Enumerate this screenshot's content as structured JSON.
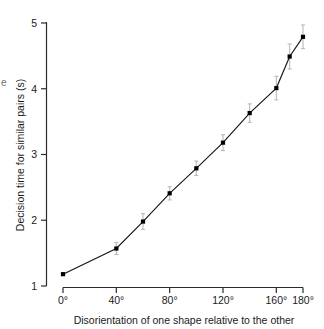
{
  "figure": {
    "partial_left_label": "e"
  },
  "chart_data": {
    "type": "line",
    "title": "",
    "subtitle": "",
    "xlabel": "Disorientation of one shape relative to the other",
    "ylabel": "Decision time for similar pairs (s)",
    "xlim": [
      0,
      180
    ],
    "ylim": [
      1,
      5
    ],
    "grid": false,
    "legend": "none",
    "x_tick_labels": [
      "0°",
      "40°",
      "80°",
      "120°",
      "160°",
      "180°"
    ],
    "x_tick_values": [
      0,
      40,
      80,
      120,
      160,
      180
    ],
    "y_tick_labels": [
      "1",
      "2",
      "3",
      "4",
      "5"
    ],
    "y_tick_values": [
      1,
      2,
      3,
      4,
      5
    ],
    "x": [
      0,
      40,
      60,
      80,
      100,
      120,
      140,
      160,
      170,
      180
    ],
    "y": [
      1.18,
      1.57,
      1.98,
      2.41,
      2.79,
      3.18,
      3.63,
      4.01,
      4.49,
      4.79
    ],
    "yerr": [
      0.0,
      0.09,
      0.12,
      0.1,
      0.11,
      0.12,
      0.14,
      0.18,
      0.19,
      0.18
    ],
    "marker": "square",
    "marker_color": "#000000",
    "line_color": "#171717",
    "errorbar_color": "#b9b9b9",
    "series": [
      {
        "name": "Decision time for similar pairs",
        "values": [
          1.18,
          1.57,
          1.98,
          2.41,
          2.79,
          3.18,
          3.63,
          4.01,
          4.49,
          4.79
        ]
      }
    ]
  }
}
